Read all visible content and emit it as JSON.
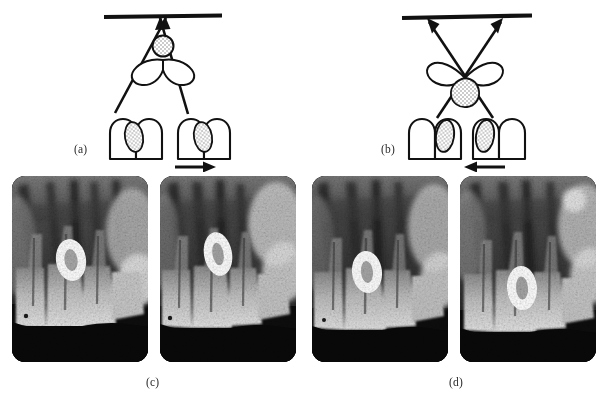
{
  "figure": {
    "panels": [
      {
        "id": "a",
        "label": "(a)",
        "caption_text": "(a)",
        "beam_description": "two converging X-ray beams meeting at a point on the film",
        "arrow_direction": "right",
        "arrow_glyph": "→",
        "film_label": "film",
        "overlap_side": "distal"
      },
      {
        "id": "b",
        "label": "(b)",
        "caption_text": "(b)",
        "beam_description": "two crossing X-ray beams diverging toward the film",
        "arrow_direction": "left",
        "arrow_glyph": "←",
        "film_label": "film",
        "overlap_side": "mesial"
      },
      {
        "id": "c",
        "label": "(c)",
        "caption_text": "(c)"
      },
      {
        "id": "d",
        "label": "(d)",
        "caption_text": "(d)"
      }
    ],
    "radiographs": [
      {
        "id": "radiograph-1",
        "group": "c",
        "marker": "oval radiopaque ring",
        "marker_shape": "oval-ring"
      },
      {
        "id": "radiograph-2",
        "group": "c",
        "marker": "oval radiopaque ring",
        "marker_shape": "oval-ring"
      },
      {
        "id": "radiograph-3",
        "group": "d",
        "marker": "oval radiopaque ring",
        "marker_shape": "oval-ring"
      },
      {
        "id": "radiograph-4",
        "group": "d",
        "marker": "oval radiopaque ring",
        "marker_shape": "oval-ring"
      }
    ],
    "colors": {
      "ink": "#111111",
      "label_text": "#2b2b2b",
      "page_background": "#ffffff",
      "radiograph_dark": "#0d0d0d",
      "radiograph_mid": "#6e6e6e",
      "radiograph_light": "#dcdcdc",
      "marker_white": "#ffffff",
      "stipple": "#9a9a9a"
    }
  }
}
